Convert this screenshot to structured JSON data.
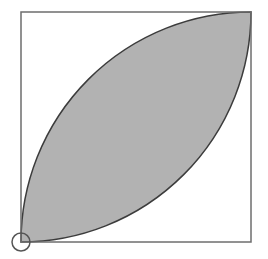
{
  "diagram": {
    "type": "geometry",
    "colors": {
      "background": "#ffffff",
      "square_stroke": "#6e6e6e",
      "lens_fill": "#b2b2b2",
      "lens_stroke": "#3c3c3c",
      "marker_stroke": "#555555"
    },
    "square": {
      "x": 21,
      "y": 12,
      "size": 230
    },
    "arcs": [
      {
        "name": "arc-centered-top-left",
        "center": [
          21,
          12
        ],
        "radius": 230
      },
      {
        "name": "arc-centered-bottom-right",
        "center": [
          251,
          242
        ],
        "radius": 230
      }
    ],
    "marker": {
      "cx": 21,
      "cy": 242,
      "r": 9
    }
  }
}
